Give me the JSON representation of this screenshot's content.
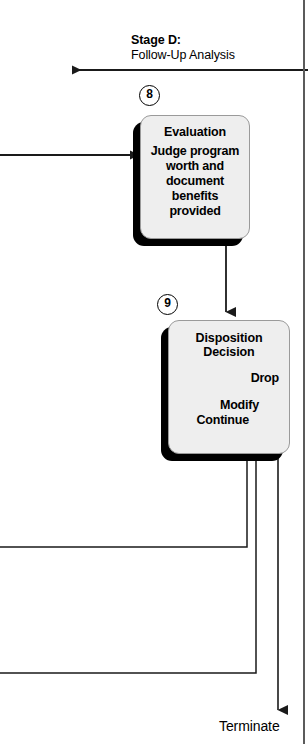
{
  "diagram": {
    "type": "flowchart",
    "stage": {
      "label": "Stage D:",
      "sublabel": "Follow-Up Analysis"
    },
    "steps": [
      {
        "number": "8",
        "title": "Evaluation",
        "body": "Judge program worth and document benefits provided"
      },
      {
        "number": "9",
        "title_line1": "Disposition",
        "title_line2": "Decision",
        "options": [
          {
            "label": "Drop"
          },
          {
            "label": "Modify"
          },
          {
            "label": "Continue"
          }
        ]
      }
    ],
    "terminal": {
      "label": "Terminate"
    },
    "colors": {
      "box_fill": "#eeeeee",
      "box_border": "#9a9a9a",
      "shadow": "#000000",
      "line": "#1a1a1a",
      "text": "#000000",
      "page_rule": "#5b5b5b"
    }
  }
}
